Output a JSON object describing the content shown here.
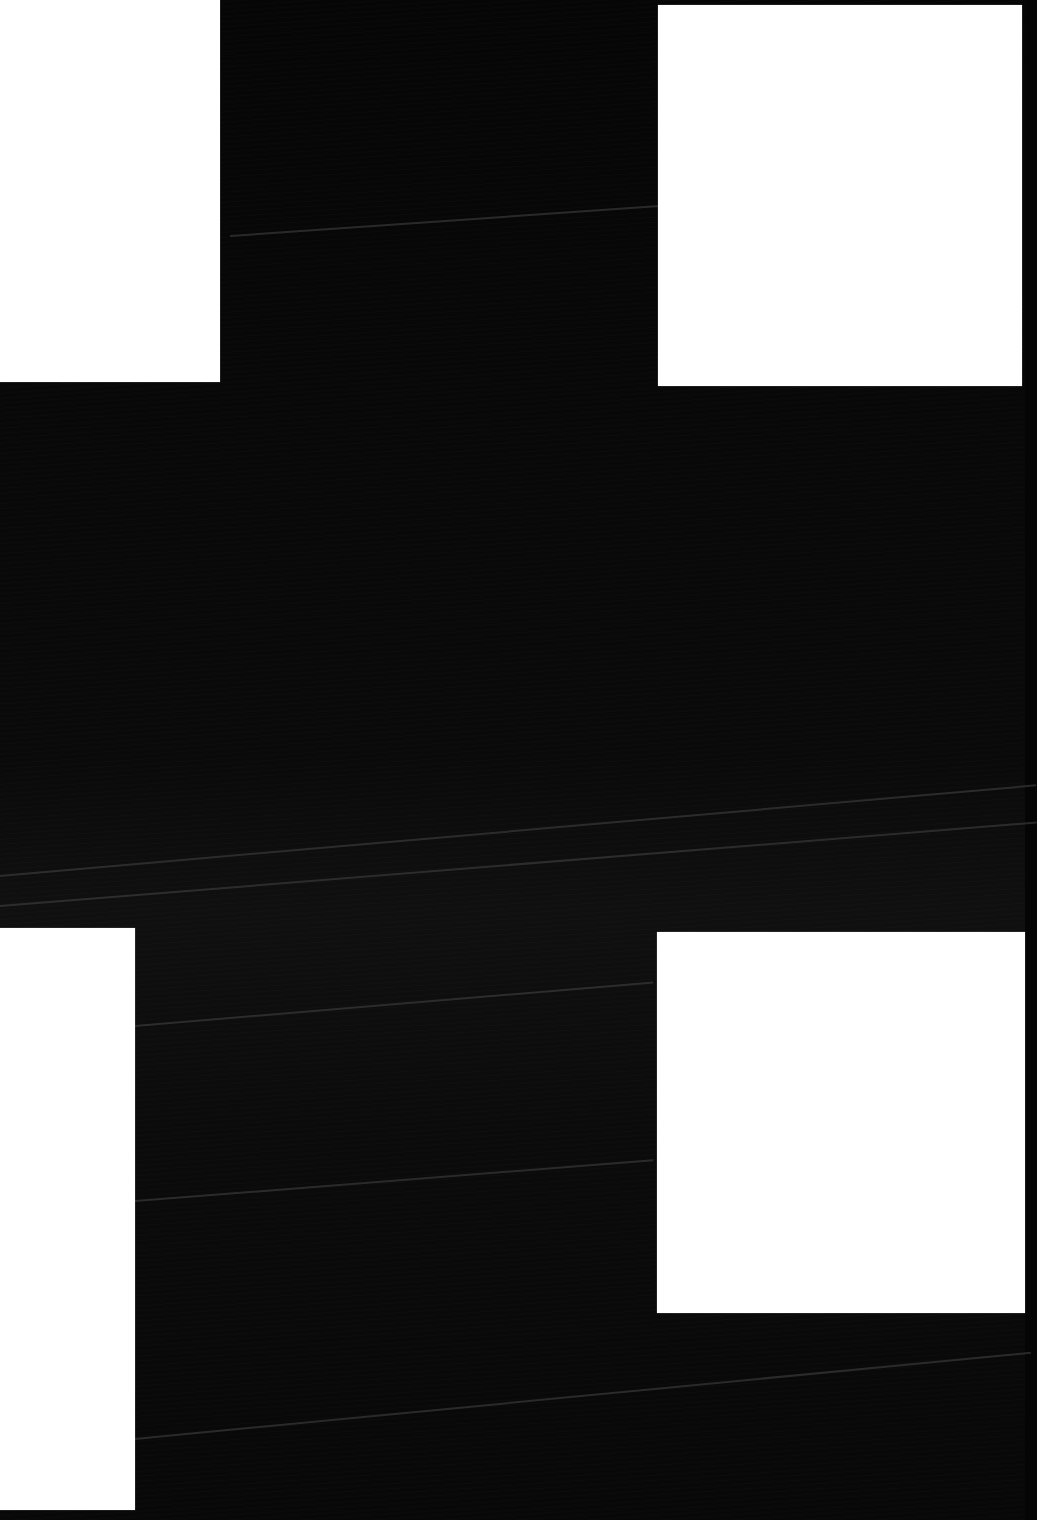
{
  "scene": {
    "description": "Four blank white rectangular sheets on a dark, finely streaked background",
    "background_color": "#050505",
    "panel_color": "#ffffff",
    "panels": [
      {
        "id": "top-left",
        "x": 0,
        "y": 0,
        "w": 220,
        "h": 382
      },
      {
        "id": "top-right",
        "x": 658,
        "y": 5,
        "w": 364,
        "h": 381
      },
      {
        "id": "bottom-left",
        "x": 0,
        "y": 928,
        "w": 135,
        "h": 582
      },
      {
        "id": "bottom-right",
        "x": 657,
        "y": 932,
        "w": 368,
        "h": 381
      }
    ],
    "streaks": [
      {
        "x": 0,
        "y": 875,
        "len": 1040,
        "angle": -5.0
      },
      {
        "x": 0,
        "y": 905,
        "len": 1040,
        "angle": -4.6
      },
      {
        "x": 135,
        "y": 1025,
        "len": 520,
        "angle": -4.8
      },
      {
        "x": 135,
        "y": 1200,
        "len": 520,
        "angle": -4.5
      },
      {
        "x": 135,
        "y": 1438,
        "len": 900,
        "angle": -5.5
      },
      {
        "x": 230,
        "y": 235,
        "len": 430,
        "angle": -4.0
      }
    ]
  }
}
